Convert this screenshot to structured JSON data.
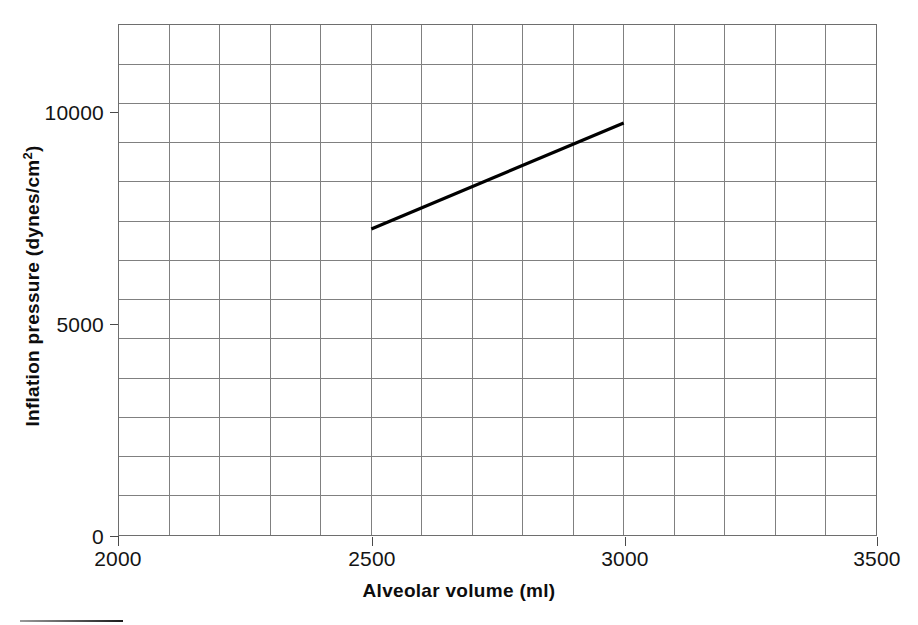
{
  "figure": {
    "background_color": "#ffffff",
    "plot_border_color": "#6e6e6e",
    "grid_color": "#808080",
    "series_color": "#000000"
  },
  "chart_data": {
    "type": "line",
    "title": "",
    "subtitle": "",
    "xlabel": "Alveolar volume (ml)",
    "ylabel": "Inflation pressure (dynes/cm²)",
    "ylabel_base": "Inflation pressure (dynes/cm",
    "ylabel_sup": "2",
    "ylabel_tail": ")",
    "xlim": [
      2000,
      3500
    ],
    "ylim": [
      0,
      12500
    ],
    "xticks": [
      2000,
      2500,
      3000,
      3500
    ],
    "xtick_labels": [
      "2000",
      "2500",
      "3000",
      "3500"
    ],
    "yticks": [
      0,
      5000,
      10000
    ],
    "ytick_labels": [
      "0",
      "5000",
      "10000"
    ],
    "grid": true,
    "grid_x_step": 100,
    "grid_y_step": 961.5,
    "grid_x_count": 15,
    "grid_y_count": 13,
    "legend": "none",
    "series": [
      {
        "name": "inflation-pressure",
        "x": [
          2500,
          3000
        ],
        "y": [
          7500,
          10100
        ],
        "line_width": 3.2,
        "color": "#000000",
        "markers": false
      }
    ]
  },
  "annotations": {
    "footer_rule": "",
    "footer_rule_color": "#1c1c1c"
  }
}
